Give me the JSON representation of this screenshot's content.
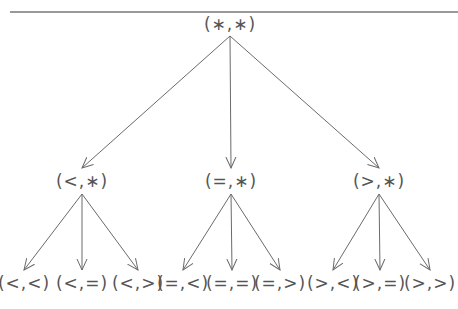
{
  "diagram": {
    "type": "tree",
    "root": {
      "id": "root",
      "label": "(∗,∗)",
      "x": 230,
      "y": 24
    },
    "level1": [
      {
        "id": "lt",
        "label": "(<,∗)",
        "x": 82,
        "y": 181
      },
      {
        "id": "eq",
        "label": "(=,∗)",
        "x": 231,
        "y": 181
      },
      {
        "id": "gt",
        "label": "(>,∗)",
        "x": 379,
        "y": 181
      }
    ],
    "level2": [
      {
        "id": "lt_lt",
        "parent": "lt",
        "label": "(<,<)",
        "x": 24,
        "y": 283
      },
      {
        "id": "lt_eq",
        "parent": "lt",
        "label": "(<,=)",
        "x": 82,
        "y": 283
      },
      {
        "id": "lt_gt",
        "parent": "lt",
        "label": "(<,>)",
        "x": 138,
        "y": 283
      },
      {
        "id": "eq_lt",
        "parent": "eq",
        "label": "(=,<)",
        "x": 183,
        "y": 283
      },
      {
        "id": "eq_eq",
        "parent": "eq",
        "label": "(=,=)",
        "x": 232,
        "y": 283
      },
      {
        "id": "eq_gt",
        "parent": "eq",
        "label": "(=,>)",
        "x": 280,
        "y": 283
      },
      {
        "id": "gt_lt",
        "parent": "gt",
        "label": "(>,<)",
        "x": 333,
        "y": 283
      },
      {
        "id": "gt_eq",
        "parent": "gt",
        "label": "(>,=)",
        "x": 380,
        "y": 283
      },
      {
        "id": "gt_gt",
        "parent": "gt",
        "label": "(>,>)",
        "x": 430,
        "y": 283
      }
    ],
    "colors": {
      "line": "#6a6a6a",
      "text": "#555555",
      "rule": "#777777"
    }
  }
}
